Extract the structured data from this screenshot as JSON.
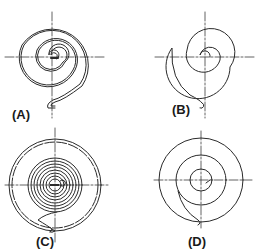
{
  "figure": {
    "panels": [
      {
        "id": "A",
        "label": "(A)",
        "description": "Double-line flat spiral spring with hooked outer end"
      },
      {
        "id": "B",
        "label": "(B)",
        "description": "Single-line flat spiral spring with small hook at outer end"
      },
      {
        "id": "C",
        "label": "(C)",
        "description": "Tightly wound spiral spring inside a housing/drum"
      },
      {
        "id": "D",
        "label": "(D)",
        "description": "Spiral spring with wide pitch and curved outer attachment"
      }
    ],
    "colors": {
      "line": "#2a2a2a",
      "centerline": "#3a3a3a",
      "background": "#ffffff"
    }
  }
}
